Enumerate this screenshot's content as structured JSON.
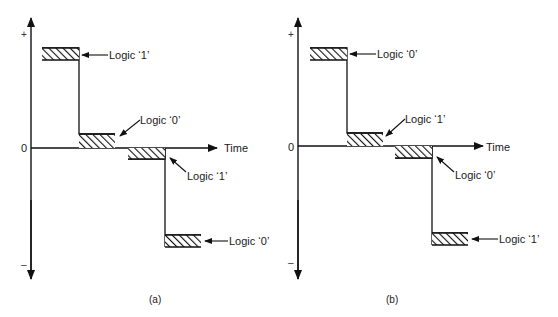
{
  "figure": {
    "panels": [
      {
        "id": "a",
        "caption": "(a)",
        "axis": {
          "plus": "+",
          "zero": "0",
          "minus": "–",
          "time_label": "Time"
        },
        "levels": [
          {
            "label": "Logic ‘1’"
          },
          {
            "label": "Logic ‘0’"
          },
          {
            "label": "Logic ‘1’"
          },
          {
            "label": "Logic ‘0’"
          }
        ]
      },
      {
        "id": "b",
        "caption": "(b)",
        "axis": {
          "plus": "+",
          "zero": "0",
          "minus": "–",
          "time_label": "Time"
        },
        "levels": [
          {
            "label": "Logic ‘0’"
          },
          {
            "label": "Logic ‘1’"
          },
          {
            "label": "Logic ‘0’"
          },
          {
            "label": "Logic ‘1’"
          }
        ]
      }
    ],
    "colors": {
      "ink": "#111111",
      "background": "#ffffff"
    }
  }
}
